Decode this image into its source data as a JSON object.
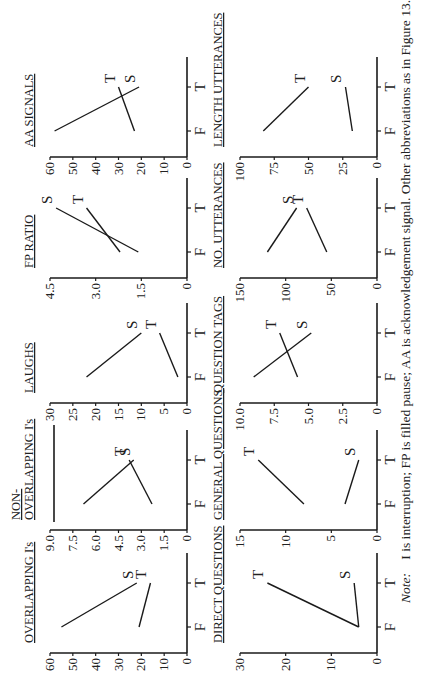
{
  "figure": {
    "note_label": "Note:",
    "note_text": "I is interruption; FP is filled pause; AA is acknowledgement signal. Other abbreviations as in Figure 13.4"
  },
  "chart_data": [
    {
      "type": "line",
      "title": "OVERLAPPING I's",
      "title_lines": [
        "OVERLAPPING I's"
      ],
      "categories": [
        "F",
        "T"
      ],
      "ylim": [
        0,
        60
      ],
      "yticks": [
        "0",
        "10",
        "20",
        "30",
        "40",
        "50",
        "60"
      ],
      "yticks_values": [
        0,
        10,
        20,
        30,
        40,
        50,
        60
      ],
      "series": [
        {
          "name": "S",
          "values": [
            55,
            22
          ]
        },
        {
          "name": "T",
          "values": [
            21,
            16
          ]
        }
      ]
    },
    {
      "type": "line",
      "title": "NON-OVERLAPPING I's",
      "title_lines": [
        "NON-",
        "OVERLAPPING I's"
      ],
      "categories": [
        "F",
        "T"
      ],
      "ylim": [
        0,
        9.0
      ],
      "yticks": [
        "0",
        "1.5",
        "3.0",
        "4.5",
        "6.0",
        "7.5",
        "9.0"
      ],
      "yticks_values": [
        0,
        1.5,
        3.0,
        4.5,
        6.0,
        7.5,
        9.0
      ],
      "series": [
        {
          "name": "S",
          "values": [
            6.8,
            3.5
          ]
        },
        {
          "name": "T",
          "values": [
            2.3,
            3.8
          ]
        }
      ]
    },
    {
      "type": "line",
      "title": "LAUGHS",
      "title_lines": [
        "LAUGHS"
      ],
      "categories": [
        "F",
        "T"
      ],
      "ylim": [
        0,
        30
      ],
      "yticks": [
        "0",
        "5",
        "10",
        "15",
        "20",
        "25",
        "30"
      ],
      "yticks_values": [
        0,
        5,
        10,
        15,
        20,
        25,
        30
      ],
      "series": [
        {
          "name": "S",
          "values": [
            22,
            10
          ]
        },
        {
          "name": "T",
          "values": [
            2,
            6
          ]
        }
      ]
    },
    {
      "type": "line",
      "title": "FP RATIO",
      "title_lines": [
        "FP RATIO"
      ],
      "categories": [
        "F",
        "T"
      ],
      "ylim": [
        0,
        4.5
      ],
      "yticks": [
        "0",
        "1.5",
        "3.0",
        "4.5"
      ],
      "yticks_values": [
        0,
        1.5,
        3.0,
        4.5
      ],
      "series": [
        {
          "name": "S",
          "values": [
            1.6,
            4.3
          ]
        },
        {
          "name": "T",
          "values": [
            2.2,
            3.3
          ]
        }
      ]
    },
    {
      "type": "line",
      "title": "AA SIGNALS",
      "title_lines": [
        "AA SIGNALS"
      ],
      "categories": [
        "F",
        "T"
      ],
      "ylim": [
        0,
        60
      ],
      "yticks": [
        "0",
        "10",
        "20",
        "30",
        "40",
        "50",
        "60"
      ],
      "yticks_values": [
        0,
        10,
        20,
        30,
        40,
        50,
        60
      ],
      "series": [
        {
          "name": "S",
          "values": [
            58,
            21
          ]
        },
        {
          "name": "T",
          "values": [
            23,
            30
          ]
        }
      ]
    },
    {
      "type": "line",
      "title": "DIRECT QUESTIONS",
      "title_lines": [
        "DIRECT QUESTIONS"
      ],
      "categories": [
        "F",
        "T"
      ],
      "ylim": [
        0,
        30
      ],
      "yticks": [
        "0",
        "10",
        "20",
        "30"
      ],
      "yticks_values": [
        0,
        10,
        20,
        30
      ],
      "series": [
        {
          "name": "T",
          "values": [
            4,
            24
          ]
        },
        {
          "name": "S",
          "values": [
            4,
            5
          ]
        }
      ]
    },
    {
      "type": "line",
      "title": "GENERAL QUESTIONS",
      "title_lines": [
        "GENERAL QUESTIONS"
      ],
      "categories": [
        "F",
        "T"
      ],
      "ylim": [
        0,
        15
      ],
      "yticks": [
        "0",
        "5",
        "10",
        "15"
      ],
      "yticks_values": [
        0,
        5,
        10,
        15
      ],
      "series": [
        {
          "name": "T",
          "values": [
            8,
            13
          ]
        },
        {
          "name": "S",
          "values": [
            3.5,
            2
          ]
        }
      ]
    },
    {
      "type": "line",
      "title": "QUESTION TAGS",
      "title_lines": [
        "QUESTION TAGS"
      ],
      "categories": [
        "F",
        "T"
      ],
      "ylim": [
        0,
        10.0
      ],
      "yticks": [
        "0",
        "2.5",
        "5.0",
        "7.5",
        "10.0"
      ],
      "yticks_values": [
        0,
        2.5,
        5.0,
        7.5,
        10.0
      ],
      "series": [
        {
          "name": "S",
          "values": [
            9,
            4.8
          ]
        },
        {
          "name": "T",
          "values": [
            5.8,
            7.1
          ]
        }
      ]
    },
    {
      "type": "line",
      "title": "NO. UTTERANCES",
      "title_lines": [
        "NO. UTTERANCES"
      ],
      "categories": [
        "F",
        "T"
      ],
      "ylim": [
        0,
        150
      ],
      "yticks": [
        "0",
        "50",
        "100",
        "150"
      ],
      "yticks_values": [
        0,
        50,
        100,
        150
      ],
      "series": [
        {
          "name": "S",
          "values": [
            120,
            88
          ]
        },
        {
          "name": "T",
          "values": [
            55,
            77
          ]
        }
      ]
    },
    {
      "type": "line",
      "title": "LENGTH UTTERANCES",
      "title_lines": [
        "LENGTH UTTERANCES"
      ],
      "categories": [
        "F",
        "T"
      ],
      "ylim": [
        0,
        100
      ],
      "yticks": [
        "0",
        "25",
        "50",
        "75",
        "100"
      ],
      "yticks_values": [
        0,
        25,
        50,
        75,
        100
      ],
      "series": [
        {
          "name": "T",
          "values": [
            83,
            50
          ]
        },
        {
          "name": "S",
          "values": [
            18,
            23
          ]
        }
      ]
    }
  ]
}
